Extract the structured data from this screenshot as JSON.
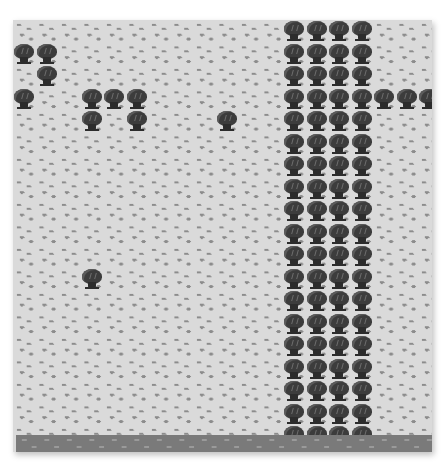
{
  "game": {
    "view": "top-down tile map",
    "tile_size_px": 22.5,
    "columns_visible": 19,
    "rows_visible": 19,
    "terrain": {
      "base": "grass",
      "bottom_strip": "water"
    },
    "colors": {
      "grass": "#dadada",
      "grass_tuft": "#8c8c8c",
      "tree": "#3c3c3c",
      "water": "#7a7a7a"
    },
    "trees": [
      {
        "col": 0,
        "row": 1
      },
      {
        "col": 1,
        "row": 1
      },
      {
        "col": 1,
        "row": 2
      },
      {
        "col": 0,
        "row": 3
      },
      {
        "col": 3,
        "row": 3
      },
      {
        "col": 4,
        "row": 3
      },
      {
        "col": 5,
        "row": 3
      },
      {
        "col": 3,
        "row": 4
      },
      {
        "col": 5,
        "row": 4
      },
      {
        "col": 9,
        "row": 4
      },
      {
        "col": 3,
        "row": 11
      },
      {
        "col": 16,
        "row": 3
      },
      {
        "col": 17,
        "row": 3
      },
      {
        "col": 18,
        "row": 3
      }
    ],
    "tree_columns": {
      "cols": [
        12,
        13,
        14,
        15
      ],
      "rows_from": 0,
      "rows_to": 18
    }
  }
}
